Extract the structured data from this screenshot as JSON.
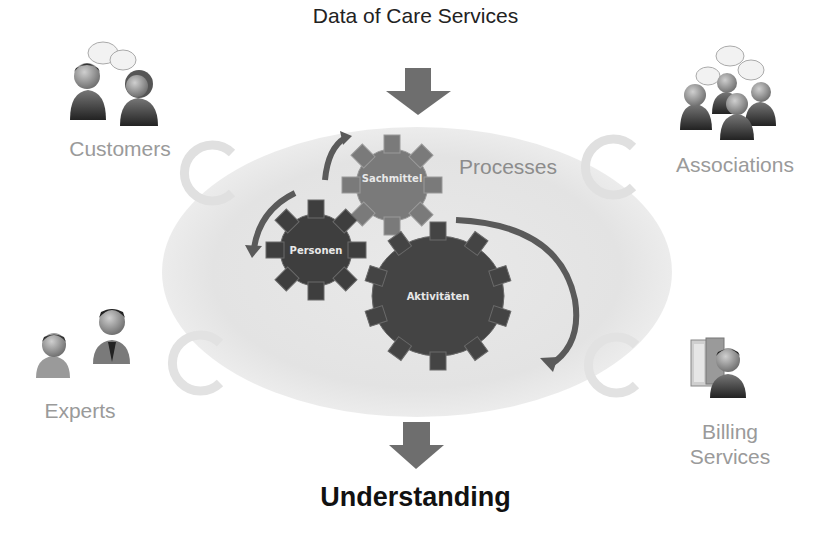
{
  "diagram": {
    "input_label": "Data of Care Services",
    "output_label": "Understanding",
    "center_label": "Processes",
    "gears": [
      {
        "label": "Sachmittel"
      },
      {
        "label": "Personen"
      },
      {
        "label": "Aktivitäten"
      }
    ],
    "stakeholders": [
      {
        "label": "Customers",
        "icon": "two-people-talking-icon",
        "position": "top-left"
      },
      {
        "label": "Associations",
        "icon": "group-people-talking-icon",
        "position": "top-right"
      },
      {
        "label": "Experts",
        "icon": "two-people-icon",
        "position": "bottom-left"
      },
      {
        "label": "Billing",
        "label2": "Services",
        "icon": "server-person-icon",
        "position": "bottom-right"
      }
    ],
    "colors": {
      "background": "#ffffff",
      "ellipse": "#e6e6e6",
      "arrow": "#6e6e6e",
      "gear_sachmittel": "#7a7a7a",
      "gear_personen": "#3e3e3e",
      "gear_aktivitaeten": "#444444",
      "cycle_ring": "#e2e2e2",
      "label_gray": "#9a9a9a"
    }
  }
}
